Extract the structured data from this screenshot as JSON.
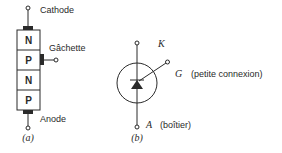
{
  "figure_a": {
    "caption": "(a)",
    "terminals": {
      "cathode": "Cathode",
      "gate": "Gâchette",
      "anode": "Anode"
    },
    "layers": [
      "N",
      "P",
      "N",
      "P"
    ]
  },
  "figure_b": {
    "caption": "(b)",
    "terminals": {
      "k": "K",
      "g": "G",
      "g_note": "(petite connexion)",
      "a": "A",
      "a_note": "(boîtier)"
    }
  },
  "colors": {
    "ink": "#2a2a2a",
    "background": "#ffffff"
  }
}
